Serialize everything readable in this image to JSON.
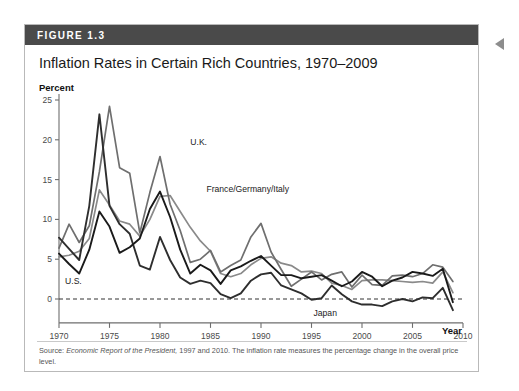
{
  "figure": {
    "label": "FIGURE 1.3",
    "title": "Inflation Rates in Certain Rich Countries, 1970–2009",
    "source_prefix": "Source:",
    "source_italic": "Economic Report of the President,",
    "source_rest": " 1997 and 2010. The inflation rate measures the percentage change in the overall price level.",
    "edge_marker_icon": "left-triangle-icon"
  },
  "chart_data": {
    "type": "line",
    "title": "Inflation Rates in Certain Rich Countries, 1970–2009",
    "xlabel": "Year",
    "ylabel": "Percent",
    "xlim": [
      1970,
      2010
    ],
    "ylim": [
      -3,
      25
    ],
    "xticks": [
      1970,
      1975,
      1980,
      1985,
      1990,
      1995,
      2000,
      2005,
      2010
    ],
    "yticks": [
      0,
      5,
      10,
      15,
      20,
      25
    ],
    "grid": false,
    "zero_line": true,
    "legend_position": "inline-annotations",
    "x": [
      1970,
      1971,
      1972,
      1973,
      1974,
      1975,
      1976,
      1977,
      1978,
      1979,
      1980,
      1981,
      1982,
      1983,
      1984,
      1985,
      1986,
      1987,
      1988,
      1989,
      1990,
      1991,
      1992,
      1993,
      1994,
      1995,
      1996,
      1997,
      1998,
      1999,
      2000,
      2001,
      2002,
      2003,
      2004,
      2005,
      2006,
      2007,
      2008,
      2009
    ],
    "series": [
      {
        "name": "U.S.",
        "color": "#1a1a1a",
        "values": [
          5.7,
          4.4,
          3.2,
          6.2,
          11.0,
          9.1,
          5.8,
          6.5,
          7.6,
          11.3,
          13.5,
          10.3,
          6.2,
          3.2,
          4.3,
          3.6,
          1.9,
          3.6,
          4.1,
          4.8,
          5.4,
          4.2,
          3.0,
          3.0,
          2.6,
          2.8,
          3.0,
          2.3,
          1.6,
          2.2,
          3.4,
          2.8,
          1.6,
          2.3,
          2.7,
          3.4,
          3.2,
          2.9,
          3.8,
          -0.4
        ]
      },
      {
        "name": "U.K.",
        "color": "#6f6f6f",
        "values": [
          6.4,
          9.4,
          7.1,
          9.2,
          16.0,
          24.2,
          16.5,
          15.8,
          8.3,
          13.4,
          17.9,
          11.9,
          8.6,
          4.6,
          5.0,
          6.1,
          3.4,
          4.2,
          4.9,
          7.8,
          9.5,
          5.9,
          3.7,
          1.6,
          2.5,
          3.4,
          2.4,
          3.1,
          3.4,
          1.5,
          3.0,
          1.8,
          1.7,
          2.9,
          3.0,
          2.8,
          3.2,
          4.3,
          4.0,
          2.2
        ]
      },
      {
        "name": "France/Germany/Italy",
        "color": "#8a8a8a",
        "values": [
          5.3,
          5.5,
          6.0,
          7.6,
          13.7,
          11.8,
          9.8,
          9.4,
          7.9,
          10.0,
          12.9,
          13.0,
          11.0,
          9.0,
          7.3,
          6.0,
          3.2,
          2.8,
          3.2,
          4.3,
          5.1,
          5.3,
          4.5,
          4.2,
          3.4,
          3.5,
          3.2,
          2.0,
          1.7,
          1.2,
          2.3,
          2.4,
          2.4,
          2.3,
          2.2,
          2.1,
          2.2,
          2.0,
          3.4,
          0.8
        ]
      },
      {
        "name": "Japan",
        "color": "#2e2e2e",
        "values": [
          7.7,
          6.3,
          4.9,
          11.7,
          23.2,
          11.7,
          9.4,
          8.2,
          4.2,
          3.7,
          7.8,
          4.9,
          2.7,
          1.9,
          2.3,
          2.0,
          0.6,
          0.1,
          0.7,
          2.3,
          3.1,
          3.3,
          1.7,
          1.2,
          0.7,
          -0.1,
          0.1,
          1.7,
          0.6,
          -0.3,
          -0.7,
          -0.7,
          -0.9,
          -0.3,
          0.0,
          -0.3,
          0.2,
          0.1,
          1.4,
          -1.4
        ]
      }
    ],
    "annotations": [
      {
        "text": "U.K.",
        "x": 1983.0,
        "y": 19.3
      },
      {
        "text": "France/Germany/Italy",
        "x": 1984.6,
        "y": 13.4
      },
      {
        "text": "U.S.",
        "x": 1970.6,
        "y": 1.9
      },
      {
        "text": "Japan",
        "x": 1995.2,
        "y": -2.1
      }
    ]
  }
}
